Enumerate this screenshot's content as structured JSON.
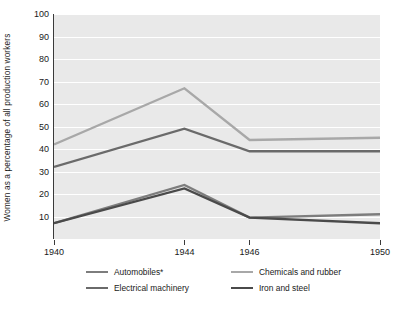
{
  "chart_data": {
    "type": "line",
    "title": "",
    "xlabel": "",
    "ylabel": "Women as a percentage of all production workers",
    "x": [
      "1940",
      "1944",
      "1946",
      "1950"
    ],
    "categories": [
      "1940",
      "1944",
      "1946",
      "1950"
    ],
    "ylim": [
      0,
      100
    ],
    "yticks": [
      10,
      20,
      30,
      40,
      50,
      60,
      70,
      80,
      90,
      100
    ],
    "grid": true,
    "legend_position": "bottom",
    "series": [
      {
        "name": "Automobiles*",
        "color": "#7d7d7d",
        "values": [
          7,
          24,
          9.5,
          11
        ]
      },
      {
        "name": "Chemicals and rubber",
        "color": "#a8a8a8",
        "values": [
          42,
          67,
          44,
          45
        ]
      },
      {
        "name": "Electrical machinery",
        "color": "#6a6a6a",
        "values": [
          32,
          49,
          39,
          39
        ]
      },
      {
        "name": "Iron and steel",
        "color": "#4a4a4a",
        "values": [
          7,
          22.5,
          9.5,
          7
        ]
      }
    ]
  },
  "axis": {
    "y_title": "Women as a percentage of all production workers",
    "y_labels": [
      "100",
      "90",
      "80",
      "70",
      "60",
      "50",
      "40",
      "30",
      "20",
      "10"
    ],
    "x_labels": [
      "1940",
      "1944",
      "1946",
      "1950"
    ]
  },
  "legend": {
    "items": [
      {
        "label": "Automobiles*",
        "color": "#7d7d7d"
      },
      {
        "label": "Chemicals and rubber",
        "color": "#a8a8a8"
      },
      {
        "label": "Electrical machinery",
        "color": "#6a6a6a"
      },
      {
        "label": "Iron and steel",
        "color": "#4a4a4a"
      }
    ]
  },
  "style": {
    "plot_background": "#e9e9e9",
    "gridline_color": "#ffffff",
    "axis_color": "#3a3a3a",
    "text_color": "#1a1a1a"
  }
}
